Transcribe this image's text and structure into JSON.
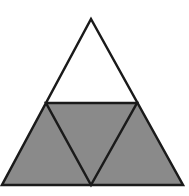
{
  "diagram": {
    "colors": {
      "background": "#ffffff",
      "shaded": "#8a8a8a",
      "unshaded": "#ffffff",
      "stroke": "#1a1a1a"
    },
    "vertices": {
      "apex": [
        91,
        19
      ],
      "bottom_left": [
        2,
        185
      ],
      "bottom_right": [
        183,
        185
      ],
      "mid_left": [
        46,
        103
      ],
      "mid_right": [
        137,
        103
      ],
      "bottom_mid": [
        91,
        185
      ]
    },
    "regions": [
      {
        "name": "top-triangle",
        "shaded": false
      },
      {
        "name": "bottom-left-triangle",
        "shaded": true
      },
      {
        "name": "center-inverted-triangle",
        "shaded": true
      },
      {
        "name": "bottom-right-triangle",
        "shaded": true
      }
    ]
  }
}
